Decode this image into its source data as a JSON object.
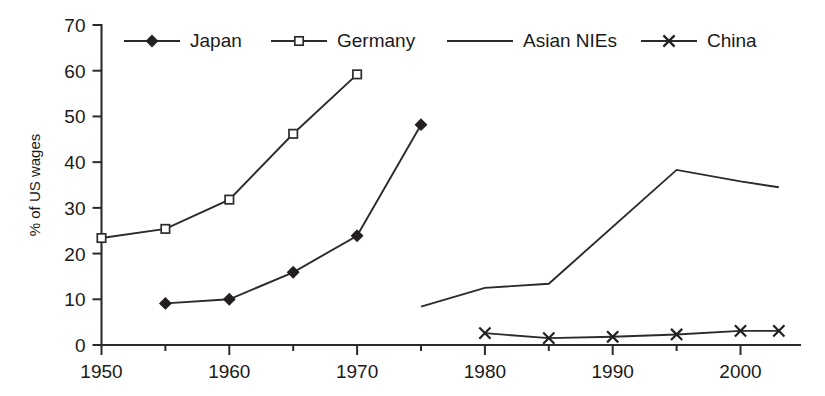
{
  "chart_data": {
    "type": "line",
    "title": "",
    "subtitle": "",
    "xlabel": "",
    "ylabel": "% of US wages",
    "xlim": [
      1950,
      2003
    ],
    "ylim": [
      0,
      70
    ],
    "grid": false,
    "legend_position": "top",
    "x_ticks": [
      1950,
      1960,
      1970,
      1980,
      1990,
      2000
    ],
    "x_tick_labels": [
      "1950",
      "1960",
      "1970",
      "1980",
      "1990",
      "2000"
    ],
    "x_minor_ticks": [
      1955,
      1965,
      1975,
      1985,
      1995
    ],
    "y_ticks": [
      0,
      10,
      20,
      30,
      40,
      50,
      60,
      70
    ],
    "y_tick_labels": [
      "0",
      "10",
      "20",
      "30",
      "40",
      "50",
      "60",
      "70"
    ],
    "series": [
      {
        "name": "Japan",
        "marker": "filled-diamond",
        "x": [
          1955,
          1960,
          1965,
          1970,
          1975
        ],
        "values": [
          9.1,
          10.0,
          15.9,
          23.9,
          48.2
        ]
      },
      {
        "name": "Germany",
        "marker": "open-square",
        "x": [
          1950,
          1955,
          1960,
          1965,
          1970
        ],
        "values": [
          23.4,
          25.4,
          31.8,
          46.2,
          59.2
        ]
      },
      {
        "name": "Asian NIEs",
        "marker": "none",
        "x": [
          1975,
          1980,
          1985,
          1995,
          2000,
          2003
        ],
        "values": [
          8.4,
          12.5,
          13.4,
          38.3,
          35.8,
          34.5
        ]
      },
      {
        "name": "China",
        "marker": "cross",
        "x": [
          1980,
          1985,
          1990,
          1995,
          2000,
          2003
        ],
        "values": [
          2.6,
          1.5,
          1.8,
          2.3,
          3.1,
          3.1
        ]
      }
    ]
  },
  "legend": {
    "entries": [
      {
        "label": "Japan",
        "marker": "filled-diamond"
      },
      {
        "label": "Germany",
        "marker": "open-square"
      },
      {
        "label": "Asian NIEs",
        "marker": "none"
      },
      {
        "label": "China",
        "marker": "cross"
      }
    ]
  },
  "colors": {
    "line": "#2b2b2b",
    "marker_fill": "#231f20",
    "marker_open_fill": "#ffffff",
    "text": "#1a1a1a",
    "background": "#ffffff"
  }
}
